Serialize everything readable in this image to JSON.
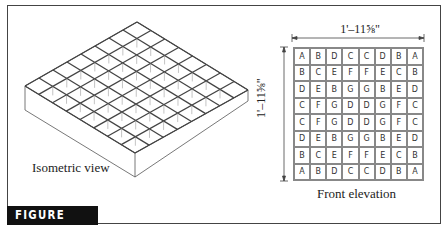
{
  "figure": {
    "label": "FIGURE 14-17"
  },
  "isometric": {
    "caption": "Isometric view"
  },
  "elevation": {
    "caption": "Front elevation",
    "dim_width": "1'–11⅝\"",
    "dim_height": "1'–11⅝\"",
    "rows": [
      [
        "A",
        "B",
        "D",
        "C",
        "C",
        "D",
        "B",
        "A"
      ],
      [
        "B",
        "C",
        "E",
        "F",
        "F",
        "E",
        "C",
        "B"
      ],
      [
        "D",
        "E",
        "B",
        "G",
        "G",
        "B",
        "E",
        "D"
      ],
      [
        "C",
        "F",
        "G",
        "D",
        "D",
        "G",
        "F",
        "C"
      ],
      [
        "C",
        "F",
        "G",
        "D",
        "D",
        "G",
        "F",
        "C"
      ],
      [
        "D",
        "E",
        "B",
        "G",
        "G",
        "B",
        "E",
        "D"
      ],
      [
        "B",
        "C",
        "E",
        "F",
        "F",
        "E",
        "C",
        "B"
      ],
      [
        "A",
        "B",
        "D",
        "C",
        "C",
        "D",
        "B",
        "A"
      ]
    ]
  },
  "colors": {
    "line": "#444444",
    "label_bg": "#111111",
    "grid_line": "#888888"
  }
}
